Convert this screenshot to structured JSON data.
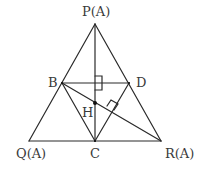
{
  "diagram": {
    "type": "geometry",
    "colors": {
      "stroke": "#2a2a2a",
      "label": "#3a3a3a",
      "background": "#ffffff"
    },
    "points": {
      "P": {
        "label": "P(A)",
        "x": 95,
        "y": 24
      },
      "Q": {
        "label": "Q(A)",
        "x": 29,
        "y": 141
      },
      "R": {
        "label": "R(A)",
        "x": 161,
        "y": 141
      },
      "B": {
        "label": "B",
        "x": 62,
        "y": 83
      },
      "D": {
        "label": "D",
        "x": 129,
        "y": 83
      },
      "C": {
        "label": "C",
        "x": 95,
        "y": 141
      },
      "H": {
        "label": "H",
        "x": 95,
        "y": 103
      }
    },
    "segments": [
      "PQ",
      "PR",
      "QR",
      "PC",
      "BD",
      "BC",
      "DC",
      "BR"
    ],
    "right_angle_markers": [
      {
        "at": "intersection of PC and BD",
        "x": 95,
        "y": 83
      },
      {
        "at": "foot of perpendicular on BR",
        "x": 112,
        "y": 109
      }
    ]
  }
}
